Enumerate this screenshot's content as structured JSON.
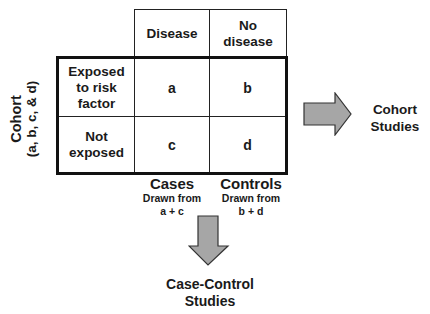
{
  "table": {
    "column_headers": [
      "Disease",
      "No disease"
    ],
    "row_headers": [
      "Exposed to risk factor",
      "Not exposed"
    ],
    "cells": [
      [
        "a",
        "b"
      ],
      [
        "c",
        "d"
      ]
    ]
  },
  "side_label": {
    "title": "Cohort",
    "subtitle": "(a, b, c, & d)"
  },
  "column_footers": [
    {
      "title": "Cases",
      "line1": "Drawn from",
      "line2": "a + c"
    },
    {
      "title": "Controls",
      "line1": "Drawn from",
      "line2": "b + d"
    }
  ],
  "arrows": {
    "right": {
      "label_line1": "Cohort",
      "label_line2": "Studies",
      "fill": "#a6a6a6"
    },
    "down": {
      "label_line1": "Case-Control",
      "label_line2": "Studies",
      "fill": "#a6a6a6"
    }
  },
  "colors": {
    "border": "#222222",
    "arrow_fill": "#a6a6a6",
    "background": "#ffffff"
  }
}
